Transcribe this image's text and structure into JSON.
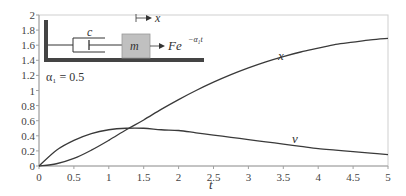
{
  "chart_data": {
    "type": "line",
    "title": "",
    "xlabel": "t",
    "ylabel": "",
    "xlim": [
      0,
      5
    ],
    "ylim": [
      0,
      2
    ],
    "grid": false,
    "legend": "none",
    "x_ticks": [
      "0",
      "0.5",
      "1",
      "1.5",
      "2",
      "2.5",
      "3",
      "3.5",
      "4",
      "4.5",
      "5"
    ],
    "y_ticks": [
      "0",
      "0.2",
      "0.4",
      "0.6",
      "0.8",
      "1",
      "1.2",
      "1.4",
      "1.6",
      "1.8",
      "2"
    ],
    "x": [
      0,
      0.25,
      0.5,
      0.75,
      1,
      1.25,
      1.5,
      1.75,
      2,
      2.25,
      2.5,
      2.75,
      3,
      3.25,
      3.5,
      3.75,
      4,
      4.25,
      4.5,
      4.75,
      5
    ],
    "series": [
      {
        "name": "x",
        "values": [
          0,
          0.03,
          0.1,
          0.21,
          0.34,
          0.48,
          0.61,
          0.75,
          0.88,
          1.0,
          1.11,
          1.21,
          1.3,
          1.38,
          1.45,
          1.51,
          1.56,
          1.61,
          1.64,
          1.67,
          1.69
        ]
      },
      {
        "name": "v",
        "values": [
          0,
          0.21,
          0.34,
          0.43,
          0.48,
          0.5,
          0.5,
          0.48,
          0.47,
          0.44,
          0.41,
          0.38,
          0.35,
          0.32,
          0.29,
          0.26,
          0.23,
          0.21,
          0.19,
          0.17,
          0.15
        ]
      }
    ],
    "annotations": [
      {
        "text": "x",
        "t": 2.85,
        "y": 1.4
      },
      {
        "text": "v",
        "t": 3.6,
        "y": 0.27
      },
      {
        "text": "α₁ = 0.5",
        "position": "inset upper-left"
      }
    ]
  },
  "diagram": {
    "damper_label": "c",
    "mass_label": "m",
    "displacement_label": "x",
    "force_label": "Fe",
    "force_exponent": "−α₁t",
    "parameter_label": "α₁ = 0.5"
  },
  "axis": {
    "x_label": "t"
  },
  "curve_labels": {
    "x": "x",
    "v": "v"
  },
  "colors": {
    "curve": "#3a3a3a",
    "axis": "#999999",
    "frame": "#c8c8c8",
    "wall": "#444444",
    "mass_fill": "#c0c0c0"
  }
}
